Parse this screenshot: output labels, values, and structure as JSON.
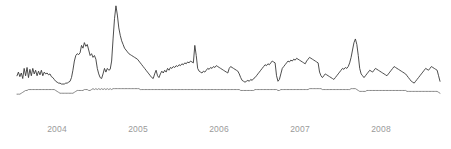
{
  "chart_data": {
    "type": "line",
    "title": "",
    "subtitle": "",
    "xlabel": "",
    "ylabel": "",
    "grid": false,
    "legend": "none",
    "axis": {
      "x_ticks": [
        "2004",
        "2005",
        "2006",
        "2007",
        "2008"
      ],
      "x_tick_positions": [
        57,
        138,
        219,
        300,
        381
      ],
      "x_range": [
        "2003-07",
        "2008-08"
      ],
      "y_range": [
        0,
        100
      ],
      "y_ticks": []
    },
    "colors": {
      "series_1": "#3a3a3a",
      "series_2": "#7a7a7a",
      "tick_label": "#9a9a9a",
      "background": "#ffffff"
    },
    "plot_area": {
      "left": 17,
      "right": 440,
      "top": 4,
      "bottom": 96
    },
    "series": [
      {
        "name": "series-1",
        "color": "#3a3a3a",
        "width": 0.9,
        "values": [
          22,
          26,
          21,
          25,
          19,
          30,
          22,
          31,
          20,
          29,
          22,
          30,
          24,
          28,
          22,
          27,
          23,
          28,
          22,
          26,
          24,
          25,
          23,
          24,
          21,
          20,
          18,
          16,
          15,
          14,
          14,
          13,
          13,
          13,
          14,
          14,
          15,
          16,
          20,
          28,
          38,
          44,
          46,
          45,
          47,
          55,
          52,
          58,
          54,
          56,
          50,
          44,
          46,
          42,
          44,
          40,
          30,
          24,
          20,
          19,
          24,
          30,
          26,
          30,
          28,
          29,
          38,
          62,
          84,
          98,
          88,
          74,
          66,
          60,
          56,
          52,
          50,
          48,
          46,
          45,
          44,
          43,
          42,
          41,
          40,
          38,
          36,
          34,
          32,
          30,
          28,
          26,
          24,
          22,
          20,
          19,
          24,
          28,
          22,
          20,
          24,
          27,
          25,
          28,
          26,
          30,
          28,
          31,
          30,
          32,
          31,
          33,
          32,
          34,
          33,
          35,
          34,
          36,
          35,
          37,
          36,
          38,
          37,
          36,
          55,
          44,
          30,
          27,
          26,
          25,
          27,
          26,
          28,
          30,
          29,
          31,
          30,
          32,
          31,
          33,
          32,
          31,
          30,
          29,
          28,
          27,
          26,
          25,
          30,
          32,
          31,
          30,
          29,
          28,
          27,
          24,
          20,
          17,
          16,
          15,
          16,
          17,
          16,
          18,
          17,
          19,
          20,
          22,
          24,
          26,
          28,
          30,
          32,
          34,
          33,
          35,
          34,
          36,
          38,
          37,
          36,
          22,
          16,
          18,
          24,
          30,
          32,
          34,
          36,
          38,
          37,
          39,
          38,
          40,
          39,
          41,
          40,
          39,
          38,
          37,
          36,
          35,
          38,
          40,
          42,
          41,
          40,
          39,
          38,
          37,
          36,
          26,
          22,
          20,
          22,
          24,
          23,
          22,
          21,
          20,
          19,
          18,
          20,
          22,
          24,
          26,
          28,
          30,
          29,
          31,
          30,
          32,
          36,
          42,
          50,
          58,
          62,
          56,
          44,
          30,
          24,
          22,
          20,
          22,
          24,
          26,
          28,
          27,
          26,
          28,
          30,
          29,
          28,
          27,
          26,
          25,
          24,
          23,
          22,
          24,
          26,
          28,
          30,
          32,
          31,
          30,
          29,
          28,
          27,
          26,
          25,
          24,
          22,
          20,
          18,
          16,
          15,
          14,
          16,
          18,
          20,
          22,
          24,
          26,
          28,
          30,
          29,
          28,
          30,
          32,
          31,
          30,
          29,
          28,
          22,
          16
        ]
      },
      {
        "name": "series-2",
        "color": "#7a7a7a",
        "width": 0.9,
        "values": [
          2,
          2,
          2,
          3,
          4,
          5,
          6,
          6,
          7,
          7,
          7,
          7,
          7,
          7,
          7,
          7,
          7,
          7,
          7,
          7,
          7,
          7,
          7,
          7,
          7,
          7,
          7,
          6,
          5,
          4,
          3,
          3,
          3,
          3,
          3,
          3,
          3,
          3,
          3,
          3,
          4,
          5,
          6,
          6,
          6,
          6,
          6,
          7,
          7,
          7,
          6,
          6,
          7,
          8,
          7,
          8,
          7,
          8,
          7,
          8,
          7,
          8,
          7,
          8,
          7,
          8,
          7,
          8,
          8,
          8,
          8,
          8,
          8,
          8,
          8,
          8,
          8,
          8,
          8,
          8,
          8,
          8,
          8,
          8,
          8,
          8,
          7,
          7,
          7,
          7,
          7,
          7,
          7,
          7,
          7,
          7,
          7,
          7,
          7,
          7,
          7,
          7,
          7,
          7,
          7,
          7,
          7,
          7,
          7,
          7,
          7,
          7,
          7,
          7,
          7,
          7,
          7,
          7,
          7,
          7,
          7,
          7,
          7,
          7,
          7,
          7,
          7,
          7,
          7,
          7,
          7,
          7,
          7,
          7,
          7,
          7,
          7,
          7,
          7,
          7,
          7,
          7,
          7,
          7,
          7,
          7,
          7,
          7,
          7,
          7,
          7,
          7,
          7,
          7,
          7,
          7,
          6,
          6,
          6,
          6,
          6,
          6,
          6,
          6,
          6,
          6,
          7,
          7,
          7,
          7,
          7,
          7,
          7,
          7,
          7,
          7,
          7,
          7,
          7,
          7,
          7,
          7,
          6,
          6,
          7,
          7,
          7,
          7,
          7,
          7,
          7,
          7,
          7,
          7,
          7,
          7,
          7,
          7,
          7,
          7,
          7,
          7,
          7,
          7,
          8,
          8,
          8,
          8,
          8,
          8,
          8,
          8,
          8,
          7,
          7,
          7,
          7,
          7,
          7,
          7,
          7,
          7,
          7,
          7,
          7,
          7,
          7,
          7,
          7,
          7,
          7,
          7,
          7,
          8,
          8,
          8,
          8,
          7,
          6,
          5,
          5,
          5,
          5,
          5,
          6,
          6,
          6,
          6,
          6,
          6,
          6,
          6,
          6,
          6,
          6,
          6,
          6,
          6,
          6,
          6,
          6,
          6,
          6,
          6,
          6,
          6,
          6,
          6,
          6,
          6,
          6,
          6,
          5,
          5,
          5,
          5,
          5,
          5,
          5,
          5,
          5,
          5,
          5,
          5,
          5,
          5,
          5,
          5,
          5,
          5,
          5,
          5,
          5,
          5,
          4,
          3
        ]
      }
    ]
  }
}
